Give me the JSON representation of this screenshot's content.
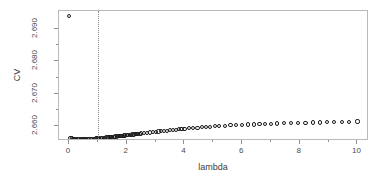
{
  "chart_data": {
    "type": "scatter",
    "title": "",
    "xlabel": "lambda",
    "ylabel": "CV",
    "xlim": [
      -0.35,
      10.4
    ],
    "ylim": [
      2.6555,
      2.6955
    ],
    "grid": false,
    "legend": null,
    "marker": "open-circle",
    "xticks": [
      0,
      2,
      4,
      6,
      8,
      10
    ],
    "xticklabels": [
      "0",
      "2",
      "4",
      "6",
      "8",
      "10"
    ],
    "xticks_minor": [
      1,
      3,
      5,
      7,
      9
    ],
    "yticks": [
      2.66,
      2.67,
      2.68,
      2.69
    ],
    "yticklabels": [
      "2.660",
      "2.670",
      "2.680",
      "2.690"
    ],
    "yticks_minor": [
      2.665,
      2.675,
      2.685
    ],
    "annotations": [
      {
        "name": "vertical-reference-line",
        "type": "vline",
        "x": 1.0,
        "style": "dotted",
        "color": "#8a8a8a"
      }
    ],
    "series": [
      {
        "name": "CV",
        "x": [
          0.0,
          0.05,
          0.1,
          0.15,
          0.2,
          0.25,
          0.3,
          0.35,
          0.4,
          0.45,
          0.5,
          0.55,
          0.6,
          0.65,
          0.7,
          0.75,
          0.8,
          0.85,
          0.9,
          0.95,
          1.0,
          1.05,
          1.1,
          1.15,
          1.2,
          1.25,
          1.3,
          1.35,
          1.4,
          1.45,
          1.5,
          1.55,
          1.6,
          1.65,
          1.7,
          1.75,
          1.8,
          1.85,
          1.9,
          1.95,
          2.0,
          2.05,
          2.1,
          2.15,
          2.2,
          2.25,
          2.3,
          2.35,
          2.4,
          2.45,
          2.5,
          2.6,
          2.7,
          2.8,
          2.9,
          3.0,
          3.1,
          3.2,
          3.3,
          3.4,
          3.5,
          3.6,
          3.7,
          3.8,
          3.9,
          4.0,
          4.15,
          4.3,
          4.45,
          4.6,
          4.75,
          4.9,
          5.05,
          5.2,
          5.4,
          5.6,
          5.8,
          6.0,
          6.2,
          6.4,
          6.6,
          6.8,
          7.0,
          7.2,
          7.45,
          7.7,
          7.95,
          8.2,
          8.45,
          8.7,
          8.95,
          9.2,
          9.45,
          9.7,
          10.0
        ],
        "y": [
          2.694,
          2.6565,
          2.6563,
          2.6562,
          2.6561,
          2.6561,
          2.656,
          2.656,
          2.656,
          2.656,
          2.656,
          2.656,
          2.656,
          2.6561,
          2.6561,
          2.6561,
          2.6562,
          2.6562,
          2.6562,
          2.6563,
          2.6563,
          2.6564,
          2.6564,
          2.6564,
          2.6565,
          2.6565,
          2.6566,
          2.6566,
          2.6567,
          2.6567,
          2.6568,
          2.6568,
          2.6569,
          2.6569,
          2.657,
          2.657,
          2.6571,
          2.6571,
          2.6572,
          2.6572,
          2.6573,
          2.6573,
          2.6574,
          2.6574,
          2.6575,
          2.6575,
          2.6576,
          2.6576,
          2.6577,
          2.6577,
          2.6578,
          2.6579,
          2.658,
          2.6581,
          2.6582,
          2.6583,
          2.6584,
          2.6585,
          2.6586,
          2.6587,
          2.6588,
          2.6589,
          2.659,
          2.6591,
          2.6592,
          2.6593,
          2.6594,
          2.6595,
          2.6596,
          2.6597,
          2.6598,
          2.6599,
          2.66,
          2.6601,
          2.6602,
          2.6603,
          2.6604,
          2.6605,
          2.6606,
          2.6606,
          2.6607,
          2.6608,
          2.6608,
          2.6609,
          2.661,
          2.661,
          2.6611,
          2.6611,
          2.6612,
          2.6612,
          2.6613,
          2.6613,
          2.6614,
          2.6614,
          2.6615
        ]
      }
    ]
  }
}
